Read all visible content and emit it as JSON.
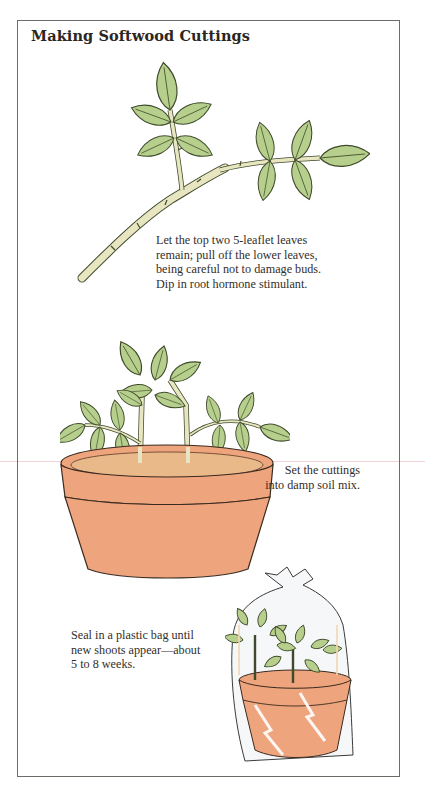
{
  "page": {
    "title": "Making Softwood Cuttings"
  },
  "steps": [
    {
      "illustration": "rose-cutting-stem-icon",
      "caption_lines": [
        "Let the top two 5-leaflet leaves",
        "remain; pull off the lower leaves,",
        "being careful not to damage buds.",
        "Dip in root hormone stimulant."
      ]
    },
    {
      "illustration": "cuttings-in-pot-icon",
      "caption_lines": [
        "Set the cuttings",
        "into damp soil mix."
      ]
    },
    {
      "illustration": "pot-in-plastic-bag-icon",
      "caption_lines": [
        "Seal in a plastic bag until",
        "new shoots appear—about",
        "5 to 8 weeks."
      ]
    }
  ],
  "colors": {
    "leaf": "#B7CF8C",
    "leaf_outline": "#3f4a2c",
    "stem": "#E8E6C0",
    "pot": "#EEA47C",
    "soil": "#E9B98A",
    "frame": "#6e6a66"
  }
}
